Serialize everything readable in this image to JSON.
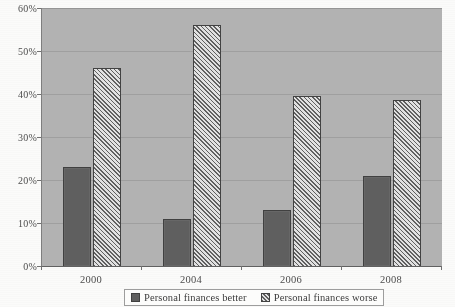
{
  "chart_data": {
    "type": "bar",
    "title": "",
    "xlabel": "",
    "ylabel": "",
    "categories": [
      "2000",
      "2004",
      "2006",
      "2008"
    ],
    "ytick_labels": [
      "0%",
      "10%",
      "20%",
      "30%",
      "40%",
      "50%",
      "60%"
    ],
    "ytick_values": [
      0,
      10,
      20,
      30,
      40,
      50,
      60
    ],
    "ylim": [
      0,
      60
    ],
    "grid": "horizontal",
    "legend_position": "bottom",
    "series": [
      {
        "name": "Personal finances better",
        "style": "solid-dark-grey",
        "color": "#5d5d5d",
        "values": [
          23,
          11,
          13,
          21
        ]
      },
      {
        "name": "Personal finances worse",
        "style": "diagonal-hatch",
        "color": "#d8d8d8",
        "values": [
          46,
          56,
          39.5,
          38.5
        ]
      }
    ]
  },
  "plot": {
    "background_color": "#b2b2b2",
    "gridline_color": "#9a9a9a",
    "axis_color": "#5f5f5f"
  },
  "legend": {
    "items": [
      {
        "label": "Personal finances better"
      },
      {
        "label": "Personal finances worse"
      }
    ]
  }
}
